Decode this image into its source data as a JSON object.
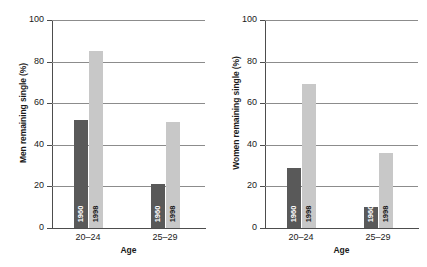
{
  "chart_data": [
    {
      "type": "bar",
      "title": "",
      "xlabel": "Age",
      "ylabel": "Men remaining single (%)",
      "categories": [
        "20–24",
        "25–29"
      ],
      "ylim": [
        0,
        100
      ],
      "yticks": [
        "0",
        "20",
        "40",
        "60",
        "80",
        "100"
      ],
      "grid": true,
      "legend": "none",
      "series": [
        {
          "name": "1960",
          "values": [
            52,
            21
          ],
          "color": "#595959"
        },
        {
          "name": "1998",
          "values": [
            85,
            51
          ],
          "color": "#c8c8c8"
        }
      ]
    },
    {
      "type": "bar",
      "title": "",
      "xlabel": "Age",
      "ylabel": "Women remaining single (%)",
      "categories": [
        "20–24",
        "25–29"
      ],
      "ylim": [
        0,
        100
      ],
      "yticks": [
        "0",
        "20",
        "40",
        "60",
        "80",
        "100"
      ],
      "grid": true,
      "legend": "none",
      "series": [
        {
          "name": "1960",
          "values": [
            29,
            10
          ],
          "color": "#595959"
        },
        {
          "name": "1998",
          "values": [
            69,
            36
          ],
          "color": "#c8c8c8"
        }
      ]
    }
  ],
  "panels": {
    "men": {
      "ylabel": "Men remaining single (%)",
      "xlabel": "Age",
      "yticks": [
        "100",
        "80",
        "60",
        "40",
        "20",
        "0"
      ],
      "groups": [
        {
          "label": "20–24",
          "bars": [
            {
              "year": "1960",
              "value": 52
            },
            {
              "year": "1998",
              "value": 85
            }
          ]
        },
        {
          "label": "25–29",
          "bars": [
            {
              "year": "1960",
              "value": 21
            },
            {
              "year": "1998",
              "value": 51
            }
          ]
        }
      ]
    },
    "women": {
      "ylabel": "Women remaining single (%)",
      "xlabel": "Age",
      "yticks": [
        "100",
        "80",
        "60",
        "40",
        "20",
        "0"
      ],
      "groups": [
        {
          "label": "20–24",
          "bars": [
            {
              "year": "1960",
              "value": 29
            },
            {
              "year": "1998",
              "value": 69
            }
          ]
        },
        {
          "label": "25–29",
          "bars": [
            {
              "year": "1960",
              "value": 10
            },
            {
              "year": "1998",
              "value": 36
            }
          ]
        }
      ]
    }
  },
  "colors": {
    "bar_1960": "#595959",
    "bar_1998": "#c8c8c8",
    "gridline": "#8c8c8c",
    "axis": "#4d4d4d",
    "text": "#1a1a1a",
    "background": "#ffffff"
  }
}
